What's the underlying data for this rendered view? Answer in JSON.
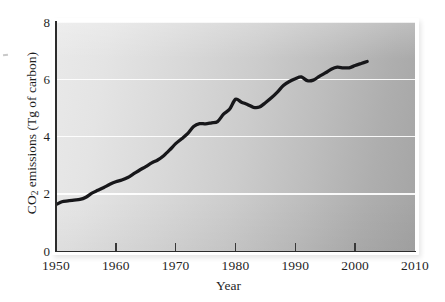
{
  "chart_data": {
    "type": "line",
    "title": "",
    "xlabel": "Year",
    "ylabel": "CO2 emissions (Tg of carbon)",
    "ylabel_parts": {
      "pre": "CO",
      "sub": "2",
      "post": " emissions (Tg of carbon)"
    },
    "xlim": [
      1950,
      2010
    ],
    "ylim": [
      0,
      8
    ],
    "xticks": [
      1950,
      1960,
      1970,
      1980,
      1990,
      2000,
      2010
    ],
    "xtick_labels": [
      "1950",
      "1960",
      "1970",
      "1980",
      "1990",
      "2000",
      "2010"
    ],
    "yticks": [
      0,
      2,
      4,
      6,
      8
    ],
    "ytick_labels": [
      "0",
      "2",
      "4",
      "6",
      "8"
    ],
    "grid": "horizontal-white",
    "legend": "none",
    "line_color": "#17171a",
    "panel_color_left": "#e9e9e9",
    "panel_color_right": "#a4a4a4",
    "x": [
      1950,
      1951,
      1952,
      1953,
      1954,
      1955,
      1956,
      1957,
      1958,
      1959,
      1960,
      1961,
      1962,
      1963,
      1964,
      1965,
      1966,
      1967,
      1968,
      1969,
      1970,
      1971,
      1972,
      1973,
      1974,
      1975,
      1976,
      1977,
      1978,
      1979,
      1980,
      1981,
      1982,
      1983,
      1984,
      1985,
      1986,
      1987,
      1988,
      1989,
      1990,
      1991,
      1992,
      1993,
      1994,
      1995,
      1996,
      1997,
      1998,
      1999,
      2000,
      2001,
      2002
    ],
    "values": [
      1.62,
      1.72,
      1.75,
      1.78,
      1.8,
      1.88,
      2.02,
      2.12,
      2.22,
      2.33,
      2.42,
      2.48,
      2.57,
      2.7,
      2.83,
      2.95,
      3.08,
      3.18,
      3.33,
      3.53,
      3.75,
      3.92,
      4.1,
      4.35,
      4.45,
      4.44,
      4.48,
      4.52,
      4.78,
      4.95,
      5.3,
      5.2,
      5.12,
      5.02,
      5.03,
      5.18,
      5.35,
      5.55,
      5.78,
      5.92,
      6.02,
      6.08,
      5.95,
      5.97,
      6.1,
      6.22,
      6.35,
      6.42,
      6.4,
      6.4,
      6.48,
      6.55,
      6.62
    ]
  },
  "axis": {
    "x_title": "Year",
    "y_title_pre": "CO",
    "y_title_sub": "2",
    "y_title_post": " emissions (Tg of carbon)"
  },
  "figure": {
    "caption": ""
  }
}
